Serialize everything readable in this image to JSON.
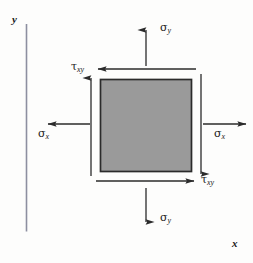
{
  "figure": {
    "background_color": "#fdfdfc",
    "axes": {
      "x_label": "x",
      "y_label": "y",
      "x_axis_color": "#8d8fa0",
      "y_axis_color": "#8d8fa0"
    },
    "element": {
      "name": "stress-element-square",
      "fill_color": "#9a9a9a",
      "stroke_color": "#2b2b2b",
      "x": 100,
      "y": 79,
      "width": 92,
      "height": 93
    },
    "arrow_color": "#2b2b2b",
    "labels": {
      "sigma_y_top": {
        "symbol": "σ",
        "subscript": "y"
      },
      "sigma_y_bottom": {
        "symbol": "σ",
        "subscript": "y"
      },
      "sigma_x_left": {
        "symbol": "σ",
        "subscript": "x"
      },
      "sigma_x_right": {
        "symbol": "σ",
        "subscript": "x"
      },
      "tau_xy_top": {
        "symbol": "τ",
        "subscript": "xy"
      },
      "tau_xy_bottom": {
        "symbol": "τ",
        "subscript": "xy"
      }
    },
    "arrows": [
      {
        "name": "sigma-y-top-arrow",
        "direction": "up",
        "x1": 146,
        "y1": 65,
        "x2": 146,
        "y2": 28
      },
      {
        "name": "sigma-y-bottom-arrow",
        "direction": "down",
        "x1": 146,
        "y1": 189,
        "x2": 146,
        "y2": 224
      },
      {
        "name": "sigma-x-left-arrow",
        "direction": "left",
        "x1": 90,
        "y1": 124,
        "x2": 46,
        "y2": 124
      },
      {
        "name": "sigma-x-right-arrow",
        "direction": "right",
        "x1": 204,
        "y1": 124,
        "x2": 248,
        "y2": 124
      },
      {
        "name": "tau-xy-top-arrow",
        "direction": "left",
        "x1": 196,
        "y1": 69,
        "x2": 96,
        "y2": 69
      },
      {
        "name": "tau-xy-bottom-arrow",
        "direction": "right",
        "x1": 96,
        "y1": 181,
        "x2": 196,
        "y2": 181
      },
      {
        "name": "tau-xy-left-arrow",
        "direction": "up",
        "x1": 91,
        "y1": 176,
        "x2": 91,
        "y2": 76
      },
      {
        "name": "tau-xy-right-arrow",
        "direction": "down",
        "x1": 201,
        "y1": 74,
        "x2": 201,
        "y2": 176
      }
    ]
  }
}
